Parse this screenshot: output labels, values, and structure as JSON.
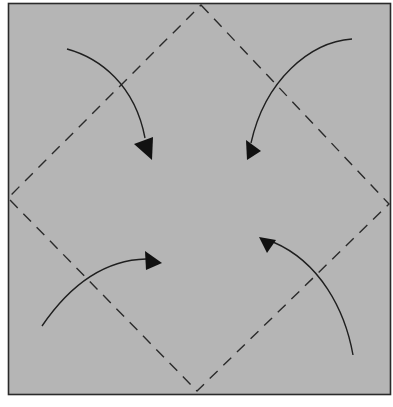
{
  "diagram": {
    "type": "origami-fold-instruction",
    "colors": {
      "paper": "#b5b5b5",
      "border": "#2a2a2a",
      "fold_line": "#2b2b2b",
      "arrow": "#1a1a1a",
      "background": "#ffffff"
    },
    "square": {
      "x": 8,
      "y": 3,
      "width": 383,
      "height": 392
    },
    "fold_lines": {
      "style": "dashed",
      "diamond_vertices": [
        {
          "name": "top",
          "x": 201,
          "y": 4
        },
        {
          "name": "right",
          "x": 390,
          "y": 204
        },
        {
          "name": "bottom",
          "x": 197,
          "y": 392
        },
        {
          "name": "left",
          "x": 7,
          "y": 198
        }
      ]
    },
    "arrows": [
      {
        "name": "top-left-corner-to-center",
        "from": {
          "x": 67,
          "y": 49
        },
        "to": {
          "x": 150,
          "y": 158
        }
      },
      {
        "name": "top-right-corner-to-center",
        "from": {
          "x": 352,
          "y": 39
        },
        "to": {
          "x": 246,
          "y": 160
        }
      },
      {
        "name": "bottom-left-corner-to-center",
        "from": {
          "x": 42,
          "y": 326
        },
        "to": {
          "x": 163,
          "y": 262
        }
      },
      {
        "name": "bottom-right-corner-to-center",
        "from": {
          "x": 353,
          "y": 355
        },
        "to": {
          "x": 258,
          "y": 240
        }
      }
    ]
  }
}
